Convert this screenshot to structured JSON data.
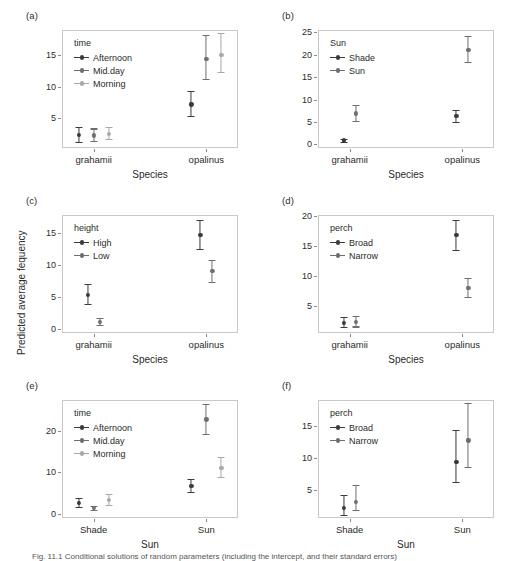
{
  "figure": {
    "width": 513,
    "height": 561,
    "ylabel": "Predicted average fequency",
    "caption": "Fig. 11.1  Conditional solutions of random parameters (including the intercept, and their standard errors)"
  },
  "colors": {
    "dark": "#3a3a3a",
    "mid": "#6e6e6e",
    "light": "#a8a8a8",
    "frame": "#c9c9c9",
    "text": "#2b2b2b"
  },
  "chart_data": [
    {
      "type": "scatter",
      "panel": "a",
      "tag": "(a)",
      "title": "",
      "xlabel": "Species",
      "ylabel": "Predicted average fequency",
      "legend_title": "time",
      "legend_position": "top-left-inside",
      "grid": false,
      "categories": [
        "grahamii",
        "opalinus"
      ],
      "yticks": [
        5,
        10,
        15
      ],
      "ylim": [
        0.3,
        19.0
      ],
      "series": [
        {
          "name": "Afternoon",
          "color": "#3a3a3a",
          "values": [
            2.4,
            7.2
          ],
          "lower": [
            1.3,
            5.4
          ],
          "upper": [
            3.6,
            9.3
          ]
        },
        {
          "name": "Mid.day",
          "color": "#6e6e6e",
          "values": [
            2.3,
            14.4
          ],
          "lower": [
            1.4,
            11.3
          ],
          "upper": [
            3.4,
            18.2
          ]
        },
        {
          "name": "Morning",
          "color": "#a8a8a8",
          "values": [
            2.5,
            15.0
          ],
          "lower": [
            1.8,
            12.4
          ],
          "upper": [
            3.7,
            18.6
          ]
        }
      ]
    },
    {
      "type": "scatter",
      "panel": "b",
      "tag": "(b)",
      "title": "",
      "xlabel": "Species",
      "ylabel": "Predicted average fequency",
      "legend_title": "Sun",
      "legend_position": "top-left-inside",
      "grid": false,
      "categories": [
        "grahamii",
        "opalinus"
      ],
      "yticks": [
        0,
        5,
        10,
        15,
        20,
        25
      ],
      "ylim": [
        -0.8,
        25.5
      ],
      "series": [
        {
          "name": "Shade",
          "color": "#3a3a3a",
          "values": [
            0.9,
            6.3
          ],
          "lower": [
            0.5,
            5.0
          ],
          "upper": [
            1.3,
            7.6
          ]
        },
        {
          "name": "Sun",
          "color": "#6e6e6e",
          "values": [
            6.9,
            21.0
          ],
          "lower": [
            5.3,
            18.3
          ],
          "upper": [
            8.8,
            24.2
          ]
        }
      ]
    },
    {
      "type": "scatter",
      "panel": "c",
      "tag": "(c)",
      "title": "",
      "xlabel": "Species",
      "ylabel": "Predicted average fequency",
      "legend_title": "height",
      "legend_position": "top-left-inside",
      "grid": false,
      "categories": [
        "grahamii",
        "opalinus"
      ],
      "yticks": [
        0,
        5,
        10,
        15
      ],
      "ylim": [
        -0.6,
        17.8
      ],
      "series": [
        {
          "name": "High",
          "color": "#3a3a3a",
          "values": [
            5.3,
            14.7
          ],
          "lower": [
            3.9,
            12.5
          ],
          "upper": [
            7.0,
            17.0
          ]
        },
        {
          "name": "Low",
          "color": "#6e6e6e",
          "values": [
            1.1,
            9.1
          ],
          "lower": [
            0.7,
            7.4
          ],
          "upper": [
            1.7,
            10.8
          ]
        }
      ]
    },
    {
      "type": "scatter",
      "panel": "d",
      "tag": "(d)",
      "title": "",
      "xlabel": "Species",
      "ylabel": "Predicted average fequency",
      "legend_title": "perch",
      "legend_position": "top-left-inside",
      "grid": false,
      "categories": [
        "grahamii",
        "opalinus"
      ],
      "yticks": [
        5,
        10,
        15,
        20
      ],
      "ylim": [
        0.4,
        20.2
      ],
      "series": [
        {
          "name": "Broad",
          "color": "#3a3a3a",
          "values": [
            2.1,
            16.8
          ],
          "lower": [
            1.4,
            14.4
          ],
          "upper": [
            3.1,
            19.4
          ]
        },
        {
          "name": "Narrow",
          "color": "#6e6e6e",
          "values": [
            2.2,
            7.9
          ],
          "lower": [
            1.5,
            6.4
          ],
          "upper": [
            3.2,
            9.6
          ]
        }
      ]
    },
    {
      "type": "scatter",
      "panel": "e",
      "tag": "(e)",
      "title": "",
      "xlabel": "Sun",
      "ylabel": "Predicted average fequency",
      "legend_title": "time",
      "legend_position": "top-left-inside",
      "grid": false,
      "categories": [
        "Shade",
        "Sun"
      ],
      "yticks": [
        0,
        10,
        20
      ],
      "ylim": [
        -1.0,
        27.5
      ],
      "series": [
        {
          "name": "Afternoon",
          "color": "#3a3a3a",
          "values": [
            2.6,
            6.8
          ],
          "lower": [
            1.7,
            5.3
          ],
          "upper": [
            3.8,
            8.5
          ]
        },
        {
          "name": "Mid.day",
          "color": "#6e6e6e",
          "values": [
            1.4,
            22.8
          ],
          "lower": [
            1.0,
            19.4
          ],
          "upper": [
            2.0,
            26.6
          ]
        },
        {
          "name": "Morning",
          "color": "#a8a8a8",
          "values": [
            3.4,
            11.1
          ],
          "lower": [
            2.2,
            8.9
          ],
          "upper": [
            4.8,
            13.7
          ]
        }
      ]
    },
    {
      "type": "scatter",
      "panel": "f",
      "tag": "(f)",
      "title": "",
      "xlabel": "Sun",
      "ylabel": "Predicted average fequency",
      "legend_title": "perch",
      "legend_position": "top-left-inside",
      "grid": false,
      "categories": [
        "Shade",
        "Sun"
      ],
      "yticks": [
        5,
        10,
        15
      ],
      "ylim": [
        0.6,
        19.0
      ],
      "series": [
        {
          "name": "Broad",
          "color": "#3a3a3a",
          "values": [
            2.2,
            9.4
          ],
          "lower": [
            1.1,
            6.2
          ],
          "upper": [
            4.2,
            14.3
          ]
        },
        {
          "name": "Narrow",
          "color": "#6e6e6e",
          "values": [
            3.1,
            12.7
          ],
          "lower": [
            1.8,
            8.5
          ],
          "upper": [
            5.8,
            18.6
          ]
        }
      ]
    }
  ]
}
